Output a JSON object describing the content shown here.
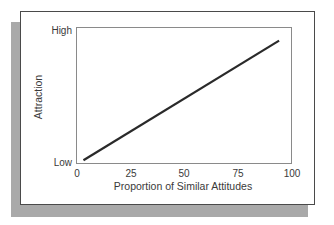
{
  "chart_data": {
    "type": "line",
    "title": "",
    "xlabel": "Proportion of Similar Attitudes",
    "ylabel": "Attraction",
    "x_ticks": [
      "0",
      "25",
      "50",
      "75",
      "100"
    ],
    "y_ticks": [
      "Low",
      "High"
    ],
    "xlim": [
      0,
      100
    ],
    "ylim": [
      "Low",
      "High"
    ],
    "ylim_numeric": [
      0,
      1
    ],
    "grid": false,
    "legend": null,
    "series": [
      {
        "name": "Attraction",
        "x": [
          3,
          94
        ],
        "y": [
          0.02,
          0.9
        ],
        "color": "#2a2a2a"
      }
    ]
  },
  "style": {
    "line_color": "#2a2a2a",
    "frame_color": "#4a4a4a",
    "plot_border_color": "#8a8a8a",
    "shadow_color": "#a9a9a9"
  }
}
